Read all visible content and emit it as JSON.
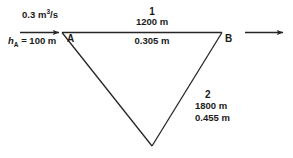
{
  "diagram": {
    "type": "pipe-network-schematic",
    "stroke_color": "#262626",
    "background_color": "#ffffff",
    "inflow": {
      "flow_rate_value": "0.3",
      "flow_rate_unit_m": "m",
      "flow_rate_unit_exp": "3",
      "flow_rate_unit_per_s": "/s",
      "head_symbol": "h",
      "head_subscript": "A",
      "head_equals": " = 100 m"
    },
    "nodes": [
      {
        "id": "A",
        "label": "A"
      },
      {
        "id": "B",
        "label": "B"
      }
    ],
    "pipes": [
      {
        "id": "1",
        "id_label": "1",
        "length": "1200 m",
        "diameter": "0.305 m"
      },
      {
        "id": "2",
        "id_label": "2",
        "length": "1800 m",
        "diameter": "0.455 m"
      }
    ]
  }
}
